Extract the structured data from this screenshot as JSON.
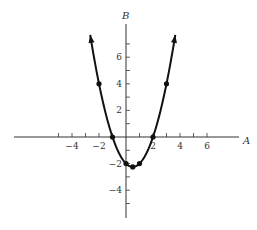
{
  "chart_data": {
    "type": "line",
    "title": "",
    "xlabel": "A",
    "ylabel": "B",
    "function": "B = A^2 - A - 2",
    "xlim": [
      -8,
      8.5
    ],
    "ylim": [
      -6,
      8.5
    ],
    "x_ticks": [
      -5,
      -4,
      -3,
      -2,
      -1,
      1,
      2,
      3,
      4,
      5,
      6
    ],
    "x_tick_labels": [
      {
        "value": -4,
        "label": "−4"
      },
      {
        "value": -2,
        "label": "−2"
      },
      {
        "value": 2,
        "label": "2"
      },
      {
        "value": 4,
        "label": "4"
      },
      {
        "value": 6,
        "label": "6"
      }
    ],
    "y_ticks": [
      -5,
      -4,
      -3,
      -2,
      -1,
      1,
      2,
      3,
      4,
      5,
      6,
      7
    ],
    "y_tick_labels": [
      {
        "value": 6,
        "label": "6"
      },
      {
        "value": 4,
        "label": "4"
      },
      {
        "value": 2,
        "label": "2"
      },
      {
        "value": -2,
        "label": "−2"
      },
      {
        "value": -4,
        "label": "−4"
      }
    ],
    "grid": false,
    "legend": "none",
    "series": [
      {
        "name": "parabola",
        "curve_domain": [
          -2.65,
          3.65
        ],
        "points": [
          {
            "x": -2,
            "y": 4
          },
          {
            "x": -1,
            "y": 0
          },
          {
            "x": 0,
            "y": -2
          },
          {
            "x": 0.5,
            "y": -2.25
          },
          {
            "x": 1,
            "y": -2
          },
          {
            "x": 2,
            "y": 0
          },
          {
            "x": 3,
            "y": 4
          }
        ],
        "arrows_at_ends": true
      }
    ]
  }
}
